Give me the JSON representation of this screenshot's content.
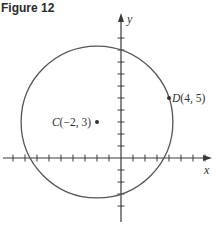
{
  "figure": {
    "title": "Figure 12"
  },
  "axes": {
    "x_label": "x",
    "y_label": "y",
    "origin_px": [
      121,
      158
    ],
    "unit_px": 12,
    "x_ticks": [
      -9,
      -8,
      -7,
      -6,
      -5,
      -4,
      -3,
      -2,
      -1,
      1,
      2,
      3,
      4,
      5,
      6,
      7
    ],
    "y_ticks": [
      -4,
      -3,
      -2,
      -1,
      1,
      2,
      3,
      4,
      5,
      6,
      7,
      8,
      9,
      10
    ]
  },
  "circle": {
    "center": [
      -2,
      3
    ],
    "through": [
      4,
      5
    ],
    "stroke_color": "#555555"
  },
  "points": [
    {
      "id": "C",
      "label": "C(−2, 3)",
      "x": -2,
      "y": 3
    },
    {
      "id": "D",
      "label": "D(4, 5)",
      "x": 4,
      "y": 5
    }
  ],
  "chart_data": {
    "type": "scatter",
    "title": "Figure 12",
    "xlabel": "x",
    "ylabel": "y",
    "series": [
      {
        "name": "points",
        "values": [
          {
            "label": "C",
            "x": -2,
            "y": 3
          },
          {
            "label": "D",
            "x": 4,
            "y": 5
          }
        ]
      }
    ],
    "shapes": [
      {
        "type": "circle",
        "center": [
          -2,
          3
        ],
        "radius": 6.3246,
        "passes_through": [
          4,
          5
        ]
      }
    ],
    "xlim": [
      -10,
      8
    ],
    "ylim": [
      -5,
      11
    ],
    "grid": false
  }
}
